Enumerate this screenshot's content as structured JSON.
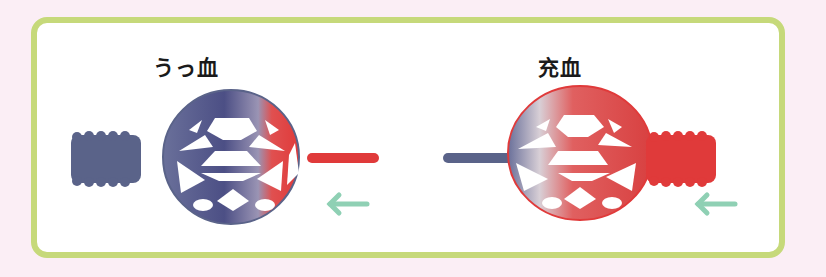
{
  "diagram": {
    "panels": [
      {
        "id": "congestion",
        "title": "うっ血",
        "left_vessel": "vein",
        "right_vessel": "artery",
        "flow_direction": "right-to-left",
        "dominant_color": "blue"
      },
      {
        "id": "hyperemia",
        "title": "充血",
        "left_vessel": "vein",
        "right_vessel": "artery",
        "flow_direction": "right-to-left",
        "dominant_color": "red"
      }
    ],
    "colors": {
      "background": "#fbeef5",
      "frame": "#c6d97a",
      "venous": "#5a6389",
      "arterial": "#e03a3a",
      "arrow": "#8fd0b4"
    }
  }
}
